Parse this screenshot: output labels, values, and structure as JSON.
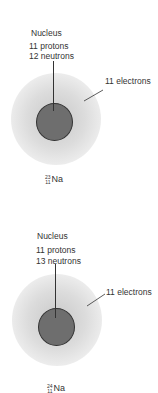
{
  "atoms": [
    {
      "nucleus_label": "Nucleus",
      "protons": "11 protons",
      "neutrons": "12 neutrons",
      "electrons": "11 electrons",
      "symbol": {
        "mass": "23",
        "atomic": "11",
        "element": "Na"
      }
    },
    {
      "nucleus_label": "Nucleus",
      "protons": "11 protons",
      "neutrons": "13 neutrons",
      "electrons": "11 electrons",
      "symbol": {
        "mass": "24",
        "atomic": "11",
        "element": "Na"
      }
    }
  ]
}
